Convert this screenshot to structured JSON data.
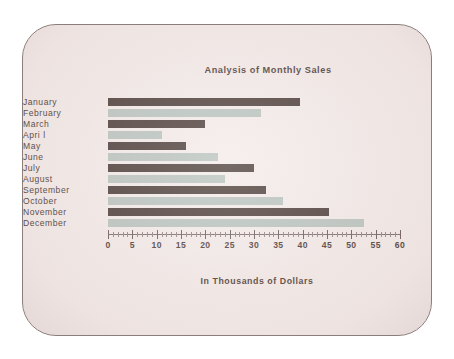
{
  "chart_data": {
    "type": "bar",
    "orientation": "horizontal",
    "title": "Analysis of Monthly Sales",
    "xlabel": "In Thousands of Dollars",
    "ylabel": "",
    "categories": [
      "January",
      "February",
      "March",
      "Apri l",
      "May",
      "June",
      "July",
      "August",
      "September",
      "October",
      "November",
      "December"
    ],
    "values": [
      39.5,
      31.5,
      20,
      11,
      16,
      22.5,
      30,
      24,
      32.5,
      36,
      45.5,
      52.5
    ],
    "bar_colors": [
      "dark",
      "light",
      "dark",
      "light",
      "dark",
      "light",
      "dark",
      "light",
      "dark",
      "light",
      "dark",
      "light"
    ],
    "xlim": [
      0,
      60
    ],
    "xticks": [
      0,
      5,
      10,
      15,
      20,
      25,
      30,
      35,
      40,
      45,
      50,
      55,
      60
    ],
    "xtick_labels": [
      "0",
      "5",
      "10",
      "15",
      "20",
      "25",
      "30",
      "35",
      "40",
      "45",
      "50",
      "55",
      "60"
    ],
    "minor_tick_step": 1,
    "grid": false,
    "legend": "none"
  },
  "colors": {
    "dark_bar": "#3a2a25",
    "light_bar": "#b2bdb7",
    "background": "#f2e9e7",
    "frame": "#8a7d7a",
    "text": "#3b2a25",
    "page": "#ffffff"
  }
}
